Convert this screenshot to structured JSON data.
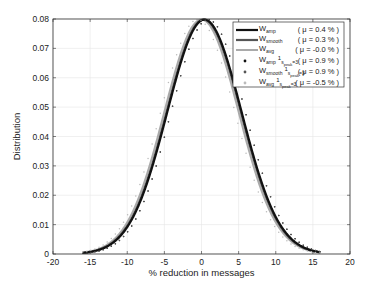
{
  "chart_data": {
    "type": "line",
    "title": "",
    "xlabel": "% reduction in messages",
    "ylabel": "Distribution",
    "xlim": [
      -20,
      20
    ],
    "ylim": [
      0,
      0.08
    ],
    "xticks": [
      -20,
      -15,
      -10,
      -5,
      0,
      5,
      10,
      15,
      20
    ],
    "xtick_labels": [
      "-20",
      "-15",
      "-10",
      "-5",
      "0",
      "5",
      "10",
      "15",
      "20"
    ],
    "yticks": [
      0,
      0.01,
      0.02,
      0.03,
      0.04,
      0.05,
      0.06,
      0.07,
      0.08
    ],
    "ytick_labels": [
      "0",
      "0.01",
      "0.02",
      "0.03",
      "0.04",
      "0.05",
      "0.06",
      "0.07",
      "0.08"
    ],
    "grid": true,
    "legend_position": "upper right",
    "x_range_of_curves": [
      -16,
      16
    ],
    "series": [
      {
        "name": "W_amp",
        "label_main": "W",
        "label_sub": "amp",
        "label_sup": "",
        "mu_label": "( μ = 0.4 % )",
        "mu": 0.4,
        "sigma": 5.0,
        "style": "line",
        "color": "#111111",
        "width": 2.2
      },
      {
        "name": "W_smooth",
        "label_main": "W",
        "label_sub": "smooth",
        "label_sup": "",
        "mu_label": "( μ = 0.3 % )",
        "mu": 0.3,
        "sigma": 5.0,
        "style": "line",
        "color": "#555555",
        "width": 2.2
      },
      {
        "name": "W_avg",
        "label_main": "W",
        "label_sub": "avg",
        "label_sup": "",
        "mu_label": "( μ = -0.0 % )",
        "mu": 0.0,
        "sigma": 5.0,
        "style": "line",
        "color": "#aaaaaa",
        "width": 2.0
      },
      {
        "name": "W_amp 1_{s_peak=3}",
        "label_main": "W",
        "label_sub": "amp",
        "label_ind": "s",
        "label_ind_sub": "peak",
        "label_ind_tail": "=3",
        "mu_label": "( μ = 0.9 % )",
        "mu": 0.9,
        "sigma": 5.0,
        "style": "dots",
        "color": "#111111",
        "width": 1.4
      },
      {
        "name": "W_smooth 1_{s_peak=3}",
        "label_main": "W",
        "label_sub": "smooth",
        "label_ind": "s",
        "label_ind_sub": "peak",
        "label_ind_tail": "=3",
        "mu_label": "( μ = 0.9 % )",
        "mu": 0.9,
        "sigma": 5.0,
        "style": "dots",
        "color": "#555555",
        "width": 1.4
      },
      {
        "name": "W_avg 1_{s_peak=3}",
        "label_main": "W",
        "label_sub": "avg",
        "label_ind": "s",
        "label_ind_sub": "peak",
        "label_ind_tail": "=3",
        "mu_label": "( μ = -0.5 % )",
        "mu": -0.5,
        "sigma": 5.0,
        "style": "dots",
        "color": "#bbbbbb",
        "width": 1.4
      }
    ]
  }
}
